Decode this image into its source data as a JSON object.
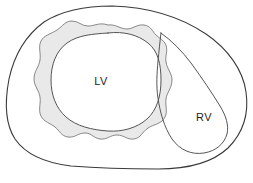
{
  "figure": {
    "kind": "anatomical-cross-section",
    "background_color": "#ffffff",
    "outline_color": "#3a3a3a",
    "inner_line_color": "#555555",
    "myocardium_fill_color": "#e9e9e9",
    "myocardium_stroke_color": "#7a7a7a",
    "cavity_fill_color": "#ffffff",
    "label_color": "#1d1d1d"
  },
  "labels": {
    "left_ventricle": "LV",
    "right_ventricle": "RV"
  },
  "label_positions": {
    "left_ventricle": {
      "x": 101,
      "y": 82
    },
    "right_ventricle": {
      "x": 204,
      "y": 118
    }
  },
  "regions": [
    {
      "name": "epicardial-outline",
      "label": "",
      "description": "outer heart border"
    },
    {
      "name": "lv-myocardium",
      "label": "",
      "description": "shaded ring with scalloped outer edge surrounding the LV cavity"
    },
    {
      "name": "lv-cavity",
      "label": "LV",
      "description": "left ventricular cavity"
    },
    {
      "name": "rv-cavity",
      "label": "RV",
      "description": "crescent-shaped right ventricular cavity"
    }
  ],
  "paths": {
    "epicardium": "M 112,6 C 150,7 182,18 206,34 C 228,49 243,70 246,92 C 249,113 243,133 228,148 C 212,163 188,169 158,169 C 126,169 96,168 71,166 C 46,163 26,155 15,139 C 4,122 5,100 9,79 C 14,56 25,36 44,22 C 63,10 87,6 112,6 Z",
    "myocardium_outer": "M 108,25 C 116,24 120,29 127,29 C 133,29 137,24 144,25 C 151,26 152,31 156,35 C 160,39 164,40 166,45 C 168,51 165,56 166,62 C 167,69 172,73 172,80 C 172,88 167,92 166,99 C 165,106 168,111 165,117 C 162,124 154,124 148,128 C 142,132 141,138 134,139 C 127,140 124,135 117,135 C 110,135 107,140 100,139 C 93,138 92,133 85,133 C 78,133 75,138 68,137 C 61,136 60,131 55,127 C 50,123 44,122 41,116 C 38,110 41,104 40,97 C 39,90 34,86 34,79 C 34,71 39,67 40,60 C 41,53 38,47 41,41 C 44,35 51,34 57,30 C 63,26 65,21 72,21 C 79,21 81,26 88,26 C 95,26 99,22 108,25 Z",
    "lv_endocardium": "M 108,33 C 124,31 138,35 148,43 C 158,51 161,64 161,80 C 161,96 157,110 147,119 C 137,128 122,132 108,131 C 92,130 76,126 66,117 C 56,108 51,95 51,80 C 51,65 56,51 67,43 C 78,35 93,34 108,33 Z",
    "rv_cavity": "M 161,33 C 160,41 159,51 158,61 C 157,73 156,86 158,98 C 160,112 164,127 172,139 C 180,150 191,155 204,153 C 216,151 224,144 227,134 C 229,125 226,116 220,106 C 212,93 202,78 191,63 C 182,51 172,41 161,33 Z"
  }
}
